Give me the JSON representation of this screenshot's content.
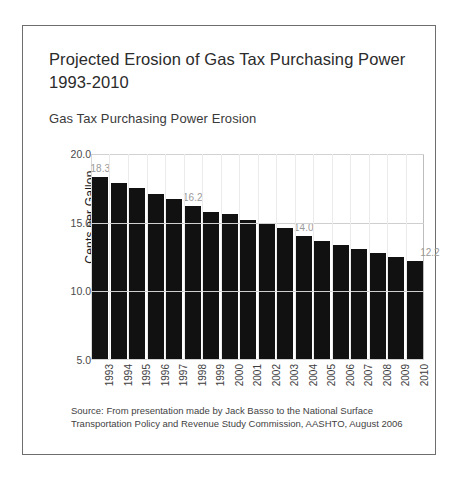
{
  "slide": {
    "title": "Projected Erosion of Gas Tax Purchasing Power 1993-2010",
    "subtitle": "Gas Tax Purchasing Power Erosion",
    "source": "Source:  From presentation made by Jack Basso to the National Surface Transportation Policy and Revenue Study Commission, AASHTO, August 2006"
  },
  "chart_data": {
    "type": "bar",
    "title": "Gas Tax Purchasing Power Erosion",
    "xlabel": "",
    "ylabel": "Cents per Gallon",
    "ylim": [
      5.0,
      20.0
    ],
    "yticks": [
      "5.0",
      "10.0",
      "15.0",
      "20.0"
    ],
    "grid": true,
    "legend": "none",
    "bar_color": "#111111",
    "label_color": "#9a9a9a",
    "categories": [
      "1993",
      "1994",
      "1995",
      "1996",
      "1997",
      "1998",
      "1999",
      "2000",
      "2001",
      "2002",
      "2003",
      "2004",
      "2005",
      "2006",
      "2007",
      "2008",
      "2009",
      "2010"
    ],
    "values": [
      18.3,
      17.9,
      17.5,
      17.1,
      16.7,
      16.2,
      15.8,
      15.6,
      15.2,
      14.9,
      14.6,
      14.0,
      13.7,
      13.4,
      13.1,
      12.8,
      12.5,
      12.2
    ],
    "point_labels": [
      {
        "category": "1993",
        "value": 18.3,
        "text": "18.3"
      },
      {
        "category": "1998",
        "value": 16.2,
        "text": "16.2"
      },
      {
        "category": "2004",
        "value": 14.0,
        "text": "14.0"
      },
      {
        "category": "2010",
        "value": 12.2,
        "text": "12.2"
      }
    ]
  }
}
